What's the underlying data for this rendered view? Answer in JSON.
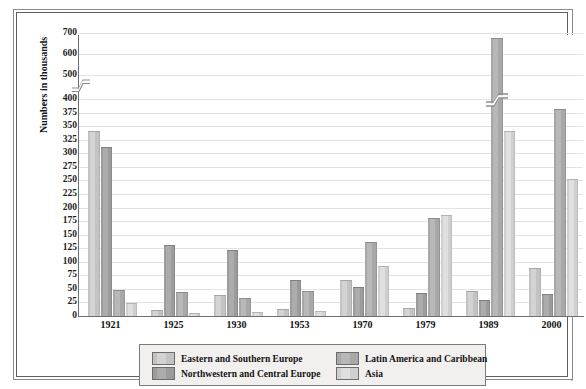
{
  "chart_data": {
    "type": "bar",
    "title": "",
    "xlabel": "",
    "ylabel": "Numbers in thousands",
    "categories": [
      "1921",
      "1925",
      "1930",
      "1953",
      "1970",
      "1979",
      "1989",
      "2000"
    ],
    "series": [
      {
        "name": "Eastern and Southern Europe",
        "color": "#c3c3c3",
        "values": [
          340,
          10,
          37,
          12,
          65,
          13,
          45,
          87
        ]
      },
      {
        "name": "Northwestern and Central Europe",
        "color": "#9c9c9c",
        "values": [
          310,
          130,
          120,
          65,
          52,
          40,
          28,
          38
        ]
      },
      {
        "name": "Latin America and Caribbean",
        "color": "#a8a8a8",
        "values": [
          47,
          42,
          32,
          45,
          135,
          178,
          670,
          380
        ]
      },
      {
        "name": "Asia",
        "color": "#cfcfcf",
        "values": [
          22,
          3,
          5,
          8,
          90,
          185,
          340,
          250
        ]
      }
    ],
    "yticks": [
      0,
      25,
      50,
      75,
      100,
      125,
      150,
      175,
      200,
      225,
      250,
      275,
      300,
      325,
      350,
      375,
      400,
      500,
      600,
      700
    ],
    "ytick_labels": [
      "0",
      "25",
      "50",
      "75",
      "100",
      "125",
      "150",
      "175",
      "200",
      "225",
      "250",
      "275",
      "300",
      "325",
      "350",
      "375",
      "400",
      "500",
      "600",
      "700"
    ],
    "ylim": [
      0,
      700
    ],
    "axis_break": {
      "present": true,
      "below": 400,
      "above": 500
    },
    "grid": true,
    "legend_position": "bottom",
    "legend": [
      {
        "label": "Eastern and Southern Europe",
        "swatch": "#c3c3c3"
      },
      {
        "label": "Northwestern and Central Europe",
        "swatch": "#9c9c9c"
      },
      {
        "label": "Latin America and Caribbean",
        "swatch": "#a8a8a8"
      },
      {
        "label": "Asia",
        "swatch": "#cfcfcf"
      }
    ]
  }
}
